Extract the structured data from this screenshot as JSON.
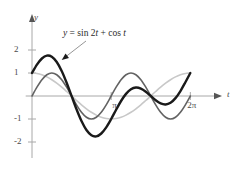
{
  "chart_data": {
    "type": "line",
    "title": "",
    "xlabel": "t",
    "ylabel": "y",
    "xlim": [
      -0.25,
      7.3
    ],
    "ylim": [
      -2.6,
      2.6
    ],
    "grid": false,
    "legend": "none",
    "annotations": [
      {
        "text": "y = sin 2t + cos t",
        "target_x": 1.1,
        "target_y": 1.5,
        "label_x": 1.55,
        "label_y": 2.25
      }
    ],
    "x_ticks": [
      {
        "value": 3.14159,
        "label": "π"
      },
      {
        "value": 6.28319,
        "label": "2π"
      }
    ],
    "y_ticks": [
      {
        "value": 2,
        "label": "2"
      },
      {
        "value": 1,
        "label": "1"
      },
      {
        "value": -1,
        "label": "-1"
      },
      {
        "value": -2,
        "label": "-2"
      }
    ],
    "series": [
      {
        "name": "cos t",
        "color": "#c8c8c8",
        "width": 1.6,
        "x": [
          0,
          0.19635,
          0.3927,
          0.58905,
          0.7854,
          0.98175,
          1.1781,
          1.37445,
          1.5708,
          1.76715,
          1.9635,
          2.15984,
          2.35619,
          2.55254,
          2.74889,
          2.94524,
          3.14159,
          3.33794,
          3.53429,
          3.73064,
          3.92699,
          4.12334,
          4.31969,
          4.51604,
          4.71239,
          4.90874,
          5.10509,
          5.30144,
          5.49779,
          5.69414,
          5.89049,
          6.08684,
          6.28319
        ],
        "y": [
          1,
          0.98079,
          0.92388,
          0.83147,
          0.70711,
          0.55557,
          0.38268,
          0.19509,
          0,
          -0.19509,
          -0.38268,
          -0.55557,
          -0.70711,
          -0.83147,
          -0.92388,
          -0.98079,
          -1,
          -0.98079,
          -0.92388,
          -0.83147,
          -0.70711,
          -0.55557,
          -0.38268,
          -0.19509,
          0,
          0.19509,
          0.38268,
          0.55557,
          0.70711,
          0.83147,
          0.92388,
          0.98079,
          1
        ]
      },
      {
        "name": "sin 2t",
        "color": "#636363",
        "width": 1.6,
        "x": [
          0,
          0.19635,
          0.3927,
          0.58905,
          0.7854,
          0.98175,
          1.1781,
          1.37445,
          1.5708,
          1.76715,
          1.9635,
          2.15984,
          2.35619,
          2.55254,
          2.74889,
          2.94524,
          3.14159,
          3.33794,
          3.53429,
          3.73064,
          3.92699,
          4.12334,
          4.31969,
          4.51604,
          4.71239,
          4.90874,
          5.10509,
          5.30144,
          5.49779,
          5.69414,
          5.89049,
          6.08684,
          6.28319
        ],
        "y": [
          0,
          0.38268,
          0.70711,
          0.92388,
          1,
          0.92388,
          0.70711,
          0.38268,
          0,
          -0.38268,
          -0.70711,
          -0.92388,
          -1,
          -0.92388,
          -0.70711,
          -0.38268,
          0,
          0.38268,
          0.70711,
          0.92388,
          1,
          0.92388,
          0.70711,
          0.38268,
          0,
          -0.38268,
          -0.70711,
          -0.92388,
          -1,
          -0.92388,
          -0.70711,
          -0.38268,
          0
        ]
      },
      {
        "name": "sin 2t + cos t",
        "color": "#1a1a1a",
        "width": 2.4,
        "x": [
          0,
          0.19635,
          0.3927,
          0.58905,
          0.7854,
          0.98175,
          1.1781,
          1.37445,
          1.5708,
          1.76715,
          1.9635,
          2.15984,
          2.35619,
          2.55254,
          2.74889,
          2.94524,
          3.14159,
          3.33794,
          3.53429,
          3.73064,
          3.92699,
          4.12334,
          4.31969,
          4.51604,
          4.71239,
          4.90874,
          5.10509,
          5.30144,
          5.49779,
          5.69414,
          5.89049,
          6.08684,
          6.28319
        ],
        "y": [
          1,
          1.36347,
          1.63099,
          1.75535,
          1.70711,
          1.47945,
          1.08979,
          0.57777,
          0,
          -0.57777,
          -1.08979,
          -1.47945,
          -1.70711,
          -1.75535,
          -1.63099,
          -1.36347,
          -1,
          -0.59811,
          -0.21677,
          0.09241,
          0.29289,
          0.36831,
          0.32443,
          0.18759,
          0,
          -0.18759,
          -0.32443,
          -0.36831,
          -0.29289,
          -0.09241,
          0.21677,
          0.59811,
          1
        ]
      }
    ]
  }
}
